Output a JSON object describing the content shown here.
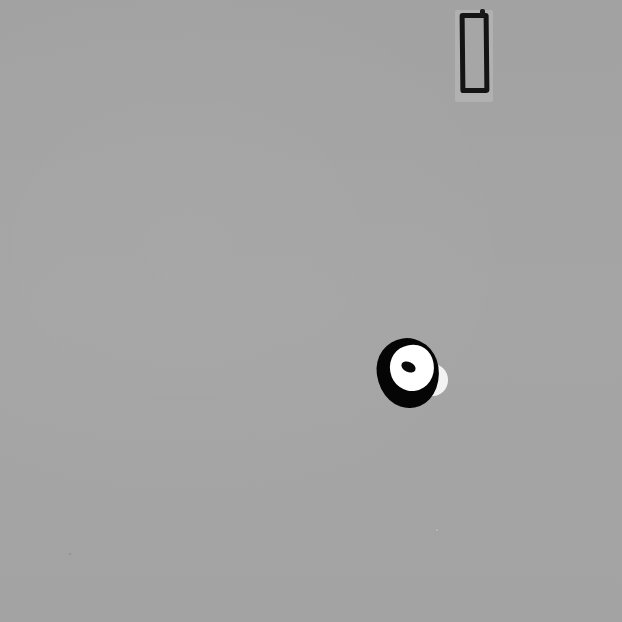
{
  "image": {
    "description": "Grayscale photograph of two small objects on a uniform gray surface",
    "background_color": "#a3a3a3",
    "objects": [
      {
        "name": "rectangular-outline-object",
        "shape": "rectangle",
        "color": "#141414",
        "backing_color": "#b1b1b1",
        "bbox": [
          455,
          10,
          493,
          102
        ]
      },
      {
        "name": "ring-object",
        "shape": "ring",
        "outer_color": "#050505",
        "inner_color": "#ffffff",
        "center_dot_color": "#0a0a0a",
        "bbox": [
          377,
          338,
          447,
          408
        ]
      }
    ]
  }
}
